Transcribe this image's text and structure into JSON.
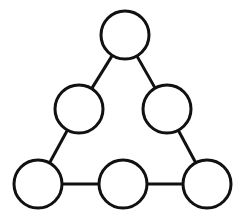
{
  "diagram": {
    "type": "triangle-node-puzzle",
    "stroke_color": "#111111",
    "fill_color": "#ffffff",
    "radius": 24,
    "nodes": [
      {
        "id": "top",
        "cx": 125,
        "cy": 35,
        "label": ""
      },
      {
        "id": "mid-left",
        "cx": 79,
        "cy": 109,
        "label": ""
      },
      {
        "id": "mid-right",
        "cx": 167,
        "cy": 109,
        "label": ""
      },
      {
        "id": "bottom-left",
        "cx": 38,
        "cy": 184,
        "label": ""
      },
      {
        "id": "bottom-mid",
        "cx": 123,
        "cy": 184,
        "label": ""
      },
      {
        "id": "bottom-right",
        "cx": 207,
        "cy": 184,
        "label": ""
      }
    ],
    "edges": [
      [
        "top",
        "mid-left"
      ],
      [
        "top",
        "mid-right"
      ],
      [
        "mid-left",
        "bottom-left"
      ],
      [
        "mid-right",
        "bottom-right"
      ],
      [
        "bottom-left",
        "bottom-mid"
      ],
      [
        "bottom-mid",
        "bottom-right"
      ]
    ]
  }
}
